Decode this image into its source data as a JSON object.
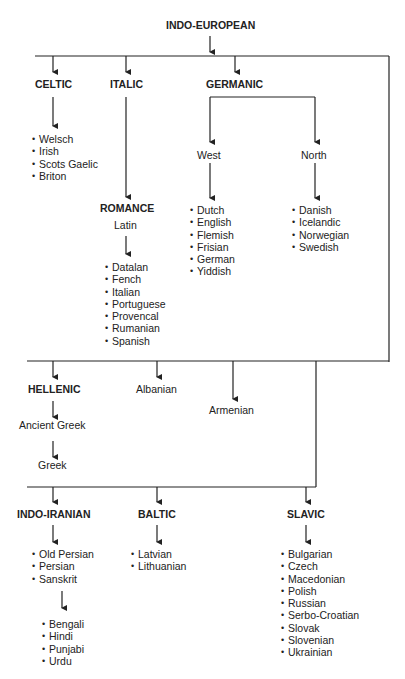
{
  "root": "INDO-EUROPEAN",
  "branches": {
    "celtic": {
      "label": "CELTIC",
      "languages": [
        "Welsch",
        "Irish",
        "Scots Gaelic",
        "Briton"
      ]
    },
    "italic": {
      "label": "ITALIC",
      "sub": "ROMANCE",
      "sub_lang": "Latin",
      "languages": [
        "Datalan",
        "Fench",
        "Italian",
        "Portuguese",
        "Provencal",
        "Rumanian",
        "Spanish"
      ]
    },
    "germanic": {
      "label": "GERMANIC",
      "west": {
        "label": "West",
        "languages": [
          "Dutch",
          "English",
          "Flemish",
          "Frisian",
          "German",
          "Yiddish"
        ]
      },
      "north": {
        "label": "North",
        "languages": [
          "Danish",
          "Icelandic",
          "Norwegian",
          "Swedish"
        ]
      }
    },
    "hellenic": {
      "label": "HELLENIC",
      "ancient": "Ancient Greek",
      "modern": "Greek"
    },
    "albanian": {
      "label": "Albanian"
    },
    "armenian": {
      "label": "Armenian"
    },
    "indo_iranian": {
      "label": "INDO-IRANIAN",
      "languages": [
        "Old Persian",
        "Persian",
        "Sanskrit"
      ],
      "sanskrit_descendants": [
        "Bengali",
        "Hindi",
        "Punjabi",
        "Urdu"
      ]
    },
    "baltic": {
      "label": "BALTIC",
      "languages": [
        "Latvian",
        "Lithuanian"
      ]
    },
    "slavic": {
      "label": "SLAVIC",
      "languages": [
        "Bulgarian",
        "Czech",
        "Macedonian",
        "Polish",
        "Russian",
        "Serbo-Croatian",
        "Slovak",
        "Slovenian",
        "Ukrainian"
      ]
    }
  }
}
